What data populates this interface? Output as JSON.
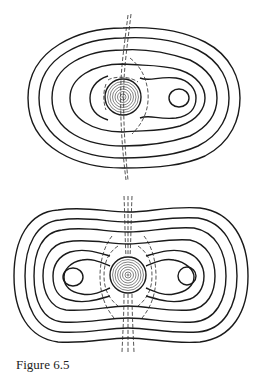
{
  "figures": [
    {
      "name": "top-contour-plot",
      "description": "Closed contour lines around a central body with one off-center lobe on the right; dashed separatrix curves",
      "center_body": {
        "cx": 123,
        "cy": 97,
        "r": 18,
        "rings": 8
      },
      "lobe_minima": [
        {
          "cx": 179,
          "cy": 98
        }
      ]
    },
    {
      "name": "bottom-contour-plot",
      "description": "Symmetric closed contour lines around a central body with two lobes left and right; dashed separatrix curves",
      "center_body": {
        "cx": 128,
        "cy": 275,
        "r": 18,
        "rings": 8
      },
      "lobe_minima": [
        {
          "cx": 73,
          "cy": 277
        },
        {
          "cx": 187,
          "cy": 276
        }
      ]
    }
  ],
  "caption": {
    "label": "Figure 6.5",
    "text": ""
  },
  "colors": {
    "line": "#1a1a1a",
    "background": "#ffffff"
  }
}
